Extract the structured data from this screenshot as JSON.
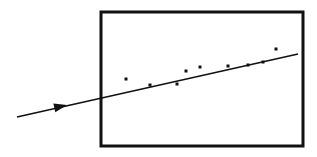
{
  "figure": {
    "title": "",
    "caption": "",
    "background_color": "#ffffff",
    "ink_color": "#111111",
    "width": 317,
    "height": 157,
    "style": "hand-drawn monochrome line sketch"
  },
  "plot_frame": {
    "name": "rectangular-plot-border",
    "x": 101,
    "y": 12,
    "width": 202,
    "height": 134,
    "stroke_color": "#111111",
    "stroke_width": 3,
    "fill": "none"
  },
  "trend_line": {
    "label": "",
    "x1": 17,
    "y1": 117,
    "x2": 298,
    "y2": 54,
    "stroke_color": "#111111",
    "stroke_width": 1.6,
    "extends_outside_frame": true,
    "arrow": {
      "name": "direction-arrowhead",
      "tip_x": 67,
      "tip_y": 105,
      "length": 13,
      "half_width": 4.5,
      "direction": "right-up"
    }
  },
  "chart_data": {
    "type": "scatter",
    "title": "",
    "subtitle": "",
    "xlabel": "",
    "ylabel": "",
    "xlim": [
      101,
      303
    ],
    "ylim": [
      12,
      146
    ],
    "grid": false,
    "legend": null,
    "annotations": [],
    "series": [
      {
        "name": "data points",
        "marker": "square-dot",
        "marker_size": 3,
        "color": "#111111",
        "points": [
          {
            "x": 126,
            "y": 79
          },
          {
            "x": 150,
            "y": 85
          },
          {
            "x": 177,
            "y": 84
          },
          {
            "x": 186,
            "y": 71
          },
          {
            "x": 200,
            "y": 67
          },
          {
            "x": 228,
            "y": 66
          },
          {
            "x": 248,
            "y": 65
          },
          {
            "x": 263,
            "y": 62
          },
          {
            "x": 276,
            "y": 49
          }
        ]
      },
      {
        "name": "fitted line",
        "marker": "none",
        "color": "#111111",
        "points": [
          {
            "x": 17,
            "y": 117
          },
          {
            "x": 298,
            "y": 54
          }
        ]
      }
    ]
  }
}
